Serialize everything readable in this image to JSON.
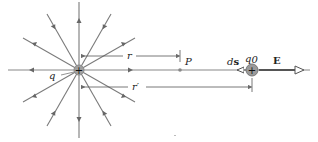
{
  "diagram": {
    "source_charge": {
      "label": "q",
      "sign": "+",
      "x": 79,
      "y": 70
    },
    "point_P": {
      "label": "P",
      "x": 180,
      "y": 70
    },
    "test_charge": {
      "label": "q0",
      "label_base": "q",
      "label_sub": "0",
      "sign": "+",
      "x": 252,
      "y": 70
    },
    "distance_r": {
      "label": "r"
    },
    "distance_r_prime": {
      "label": "r′"
    },
    "displacement": {
      "label_d": "d",
      "label_s": "s"
    },
    "field": {
      "label": "E"
    },
    "field_line_count": 16,
    "colors": {
      "line": "#7a7a7a",
      "charge_fill": "#a0a0a0",
      "text": "#222222"
    }
  }
}
